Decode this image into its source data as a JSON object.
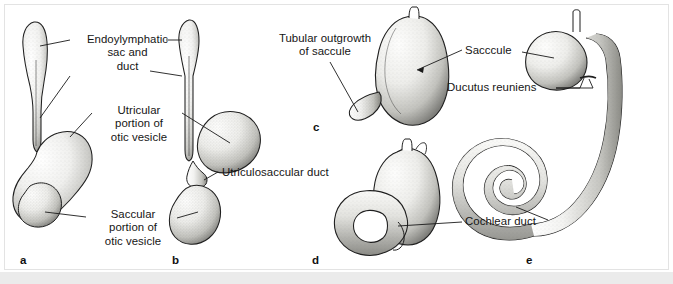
{
  "figure": {
    "panels": [
      {
        "id": "a",
        "letter": "a",
        "x": 44,
        "y": 255
      },
      {
        "id": "b",
        "letter": "b",
        "x": 172,
        "y": 255
      },
      {
        "id": "c",
        "letter": "c",
        "x": 315,
        "y": 125
      },
      {
        "id": "d",
        "letter": "d",
        "x": 313,
        "y": 258
      },
      {
        "id": "e",
        "letter": "e",
        "x": 527,
        "y": 258
      }
    ],
    "labels": [
      {
        "name": "endolymphatic-sac-and-duct",
        "text": "Endoylymphatic\nsac and\nduct",
        "x": 75,
        "y": 33,
        "w": 105,
        "align": "center"
      },
      {
        "name": "utricular-portion-of-otic-vesicle",
        "text": "Utricular\nportion of\notic vesicle",
        "x": 96,
        "y": 104,
        "w": 86,
        "align": "center"
      },
      {
        "name": "saccular-portion-of-otic-vesicle",
        "text": "Saccular\nportion of\notic vesicle",
        "x": 90,
        "y": 208,
        "w": 86,
        "align": "center"
      },
      {
        "name": "utriculosaccular-duct",
        "text": "Utriculosaccular duct",
        "x": 222,
        "y": 168,
        "w": 120,
        "align": "left"
      },
      {
        "name": "tubular-outgrowth-of-saccule",
        "text": "Tubular outgrowth\nof saccule",
        "x": 270,
        "y": 34,
        "w": 112,
        "align": "center"
      },
      {
        "name": "sacccule",
        "text": "Sacccule",
        "x": 465,
        "y": 47,
        "w": 54,
        "align": "left"
      },
      {
        "name": "ducutus-reuniens",
        "text": "Ducutus reuniens",
        "x": 447,
        "y": 84,
        "w": 106,
        "align": "left"
      },
      {
        "name": "cochlear-duct",
        "text": "Cochlear duct",
        "x": 465,
        "y": 217,
        "w": 82,
        "align": "left"
      }
    ],
    "colors": {
      "ink": "#1a1a1a",
      "paper": "#ffffff",
      "frame": "#e3e3e3",
      "strip": "#ebebeb",
      "stipple": "#5a5a5a"
    }
  }
}
